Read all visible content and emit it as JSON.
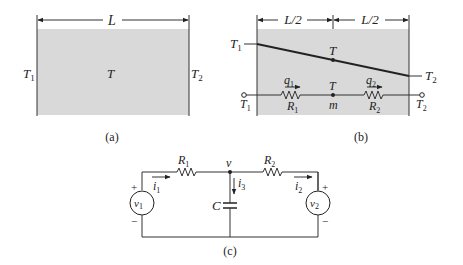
{
  "figure_a": {
    "caption": "(a)",
    "length_label": "L",
    "left_temp": "T",
    "left_temp_sub": "1",
    "center_temp": "T",
    "right_temp": "T",
    "right_temp_sub": "2"
  },
  "figure_b": {
    "caption": "(b)",
    "half_length_left": "L/2",
    "half_length_right": "L/2",
    "left_profile_label": "T",
    "left_profile_sub": "1",
    "right_profile_label": "T",
    "right_profile_sub": "2",
    "mid_temp_label": "T",
    "mid_node_temp": "T",
    "mid_node_label": "m",
    "flow1": "q",
    "flow1_sub": "1",
    "flow2": "q",
    "flow2_sub": "2",
    "resistor1": "R",
    "resistor1_sub": "1",
    "resistor2": "R",
    "resistor2_sub": "2",
    "left_terminal": "T",
    "left_terminal_sub": "1",
    "right_terminal": "T",
    "right_terminal_sub": "2"
  },
  "figure_c": {
    "caption": "(c)",
    "resistor1": "R",
    "resistor1_sub": "1",
    "resistor2": "R",
    "resistor2_sub": "2",
    "node_voltage": "v",
    "current1": "i",
    "current1_sub": "1",
    "current2": "i",
    "current2_sub": "2",
    "current3": "i",
    "current3_sub": "3",
    "capacitor": "C",
    "source1": "v",
    "source1_sub": "1",
    "source2": "v",
    "source2_sub": "2",
    "plus": "+",
    "minus": "−"
  },
  "colors": {
    "slab_fill": "#d9d9d9",
    "line": "#222222"
  }
}
